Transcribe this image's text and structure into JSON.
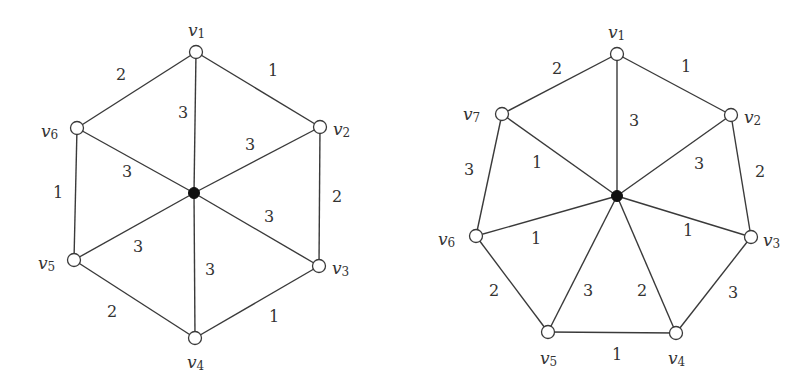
{
  "graphs": [
    {
      "name": "wheel-6",
      "hub": {
        "x": 194,
        "y": 193
      },
      "vertices": [
        {
          "id": "v1",
          "sub": "1",
          "x": 196,
          "y": 52,
          "lx": 188,
          "ly": 30,
          "anchor": "start"
        },
        {
          "id": "v2",
          "sub": "2",
          "x": 320,
          "y": 127,
          "lx": 333,
          "ly": 129,
          "anchor": "start"
        },
        {
          "id": "v3",
          "sub": "3",
          "x": 319,
          "y": 266,
          "lx": 332,
          "ly": 268,
          "anchor": "start"
        },
        {
          "id": "v4",
          "sub": "4",
          "x": 195,
          "y": 338,
          "lx": 187,
          "ly": 362,
          "anchor": "start"
        },
        {
          "id": "v5",
          "sub": "5",
          "x": 74,
          "y": 260,
          "lx": 38,
          "ly": 263,
          "anchor": "start"
        },
        {
          "id": "v6",
          "sub": "6",
          "x": 77,
          "y": 128,
          "lx": 41,
          "ly": 131,
          "anchor": "start"
        }
      ],
      "rim_edges": [
        {
          "from": "v1",
          "to": "v2",
          "weight": "1",
          "lx": 273,
          "ly": 70
        },
        {
          "from": "v2",
          "to": "v3",
          "weight": "2",
          "lx": 337,
          "ly": 196
        },
        {
          "from": "v3",
          "to": "v4",
          "weight": "1",
          "lx": 274,
          "ly": 316
        },
        {
          "from": "v4",
          "to": "v5",
          "weight": "2",
          "lx": 112,
          "ly": 311
        },
        {
          "from": "v5",
          "to": "v6",
          "weight": "1",
          "lx": 58,
          "ly": 192
        },
        {
          "from": "v6",
          "to": "v1",
          "weight": "2",
          "lx": 121,
          "ly": 74
        }
      ],
      "spoke_edges": [
        {
          "to": "v1",
          "weight": "3",
          "lx": 183,
          "ly": 112
        },
        {
          "to": "v2",
          "weight": "3",
          "lx": 250,
          "ly": 144
        },
        {
          "to": "v3",
          "weight": "3",
          "lx": 269,
          "ly": 216
        },
        {
          "to": "v4",
          "weight": "3",
          "lx": 210,
          "ly": 269
        },
        {
          "to": "v5",
          "weight": "3",
          "lx": 138,
          "ly": 246
        },
        {
          "to": "v6",
          "weight": "3",
          "lx": 127,
          "ly": 171
        }
      ]
    },
    {
      "name": "wheel-7",
      "hub": {
        "x": 617,
        "y": 196
      },
      "vertices": [
        {
          "id": "v1",
          "sub": "1",
          "x": 617,
          "y": 54,
          "lx": 608,
          "ly": 32,
          "anchor": "start"
        },
        {
          "id": "v2",
          "sub": "2",
          "x": 731,
          "y": 115,
          "lx": 744,
          "ly": 117,
          "anchor": "start"
        },
        {
          "id": "v3",
          "sub": "3",
          "x": 751,
          "y": 237,
          "lx": 763,
          "ly": 240,
          "anchor": "start"
        },
        {
          "id": "v4",
          "sub": "4",
          "x": 676,
          "y": 333,
          "lx": 668,
          "ly": 358,
          "anchor": "start"
        },
        {
          "id": "v5",
          "sub": "5",
          "x": 548,
          "y": 332,
          "lx": 540,
          "ly": 358,
          "anchor": "start"
        },
        {
          "id": "v6",
          "sub": "6",
          "x": 476,
          "y": 236,
          "lx": 438,
          "ly": 239,
          "anchor": "start"
        },
        {
          "id": "v7",
          "sub": "7",
          "x": 502,
          "y": 114,
          "lx": 463,
          "ly": 114,
          "anchor": "start"
        }
      ],
      "rim_edges": [
        {
          "from": "v1",
          "to": "v2",
          "weight": "1",
          "lx": 686,
          "ly": 66
        },
        {
          "from": "v2",
          "to": "v3",
          "weight": "2",
          "lx": 760,
          "ly": 171
        },
        {
          "from": "v3",
          "to": "v4",
          "weight": "3",
          "lx": 733,
          "ly": 292
        },
        {
          "from": "v4",
          "to": "v5",
          "weight": "1",
          "lx": 617,
          "ly": 354
        },
        {
          "from": "v5",
          "to": "v6",
          "weight": "2",
          "lx": 494,
          "ly": 290
        },
        {
          "from": "v6",
          "to": "v7",
          "weight": "3",
          "lx": 469,
          "ly": 169
        },
        {
          "from": "v7",
          "to": "v1",
          "weight": "2",
          "lx": 557,
          "ly": 68
        }
      ],
      "spoke_edges": [
        {
          "to": "v1",
          "weight": "3",
          "lx": 634,
          "ly": 120
        },
        {
          "to": "v2",
          "weight": "3",
          "lx": 699,
          "ly": 163
        },
        {
          "to": "v3",
          "weight": "1",
          "lx": 688,
          "ly": 230
        },
        {
          "to": "v4",
          "weight": "2",
          "lx": 642,
          "ly": 290
        },
        {
          "to": "v5",
          "weight": "3",
          "lx": 588,
          "ly": 290
        },
        {
          "to": "v6",
          "weight": "1",
          "lx": 536,
          "ly": 238
        },
        {
          "to": "v7",
          "weight": "1",
          "lx": 537,
          "ly": 162
        }
      ]
    }
  ],
  "style": {
    "edge_color": "#3a3a3a",
    "hub_color": "#111111",
    "vertex_fill": "#ffffff"
  }
}
